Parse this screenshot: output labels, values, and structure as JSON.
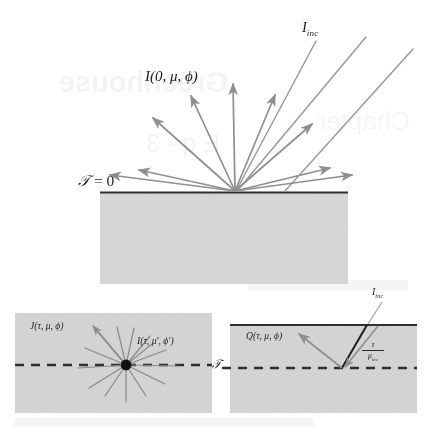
{
  "figure": {
    "background_color": "#ffffff",
    "ray_color": "#8f8f8f",
    "slab_fill": "#d6d6d6",
    "surface_line_color": "#2f2f2f",
    "dashed_line_color": "#2f2f2f",
    "point_color": "#111111"
  },
  "top_panel": {
    "name": "top-slab-panel",
    "surface_label": "𝒯 = 0",
    "surface_label_tau": "𝒯",
    "surface_label_rest": " = 0",
    "incident_label": "I",
    "incident_sub": "inc",
    "outgoing_label_main": "I",
    "outgoing_label_args": "(0, μ, ϕ)",
    "slab": {
      "x": 100,
      "y": 192,
      "width": 248,
      "height": 92
    },
    "origin": {
      "x": 235,
      "y": 192
    },
    "incident_rays": [
      {
        "name": "incident-ray-1",
        "x1": 316,
        "y1": 40,
        "x2": 235,
        "y2": 192
      },
      {
        "name": "incident-ray-2",
        "x1": 365,
        "y1": 36,
        "x2": 235,
        "y2": 192
      },
      {
        "name": "incident-ray-3",
        "x1": 412,
        "y1": 48,
        "x2": 235,
        "y2": 192
      }
    ],
    "outgoing_rays": [
      {
        "name": "outgoing-ray-1",
        "angle_deg": 178,
        "length": 127
      },
      {
        "name": "outgoing-ray-2",
        "angle_deg": 152,
        "length": 106
      },
      {
        "name": "outgoing-ray-3",
        "angle_deg": 124,
        "length": 104
      },
      {
        "name": "outgoing-ray-4",
        "angle_deg": 91,
        "length": 104
      },
      {
        "name": "outgoing-ray-5",
        "angle_deg": 66,
        "length": 101
      },
      {
        "name": "outgoing-ray-6",
        "angle_deg": 40,
        "length": 100
      },
      {
        "name": "outgoing-ray-7",
        "angle_deg": 16,
        "length": 110
      },
      {
        "name": "outgoing-ray-8",
        "angle_deg": 4,
        "length": 122
      }
    ]
  },
  "bottom_left_panel": {
    "name": "source-function-panel",
    "slab": {
      "x": 15,
      "y": 313,
      "width": 197,
      "height": 100
    },
    "dashed_y": 365,
    "scatter_point": {
      "x": 126,
      "y": 365
    },
    "label_j": "J",
    "label_j_args": "(τ, μ, ϕ)",
    "label_i": "I",
    "label_i_args": "(τ, μ′, ϕ′)",
    "ray_count": 12
  },
  "bottom_right_panel": {
    "name": "direct-beam-source-panel",
    "slab": {
      "x": 230,
      "y": 325,
      "width": 187,
      "height": 88
    },
    "dashed_y": 368,
    "surface_y": 325,
    "scatter_point": {
      "x": 341,
      "y": 368
    },
    "label_q": "Q",
    "label_q_args": "(τ, μ, ϕ)",
    "label_iinc": "I",
    "label_iinc_sub": "inc",
    "path_fraction_numerator": "τ",
    "path_fraction_denominator": "μ",
    "path_fraction_denominator_sub": "inc",
    "beam_entry": {
      "x": 366,
      "y": 325
    },
    "tau_axis_label": "𝒯"
  },
  "middle_labels": {
    "tau_between_panels": "𝒯"
  }
}
